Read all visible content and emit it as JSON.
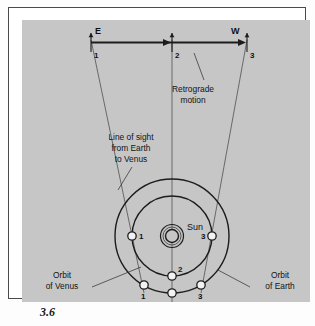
{
  "figure": {
    "caption_number": "3.6",
    "panel_bg_color": "#c6c6c6",
    "ink_color": "#1c1c1c"
  },
  "sky_scale": {
    "description": "Apparent path of Venus against the background sky",
    "direction_left_label": "E",
    "direction_right_label": "W",
    "tick_labels": [
      "1",
      "2",
      "3"
    ],
    "arrow_segments": [
      {
        "from": "1",
        "to": "2"
      },
      {
        "from": "2",
        "to": "3"
      }
    ]
  },
  "annotations": {
    "retrograde": {
      "line1": "Retrograde",
      "line2": "motion"
    },
    "line_of_sight": {
      "line1": "Line of sight",
      "line2": "from Earth",
      "line3": "to Venus"
    },
    "orbit_venus": {
      "line1": "Orbit",
      "line2": "of Venus"
    },
    "orbit_earth": {
      "line1": "Orbit",
      "line2": "of Earth"
    },
    "sun_label": "Sun"
  },
  "orbits": {
    "venus": {
      "name": "Orbit of Venus",
      "position_labels": [
        "1",
        "2",
        "3"
      ]
    },
    "earth": {
      "name": "Orbit of Earth",
      "position_labels": [
        "1",
        "2",
        "3"
      ]
    }
  },
  "bodies": {
    "sun": "Sun",
    "venus_markers": [
      "1",
      "2",
      "3"
    ],
    "earth_markers": [
      "1",
      "2",
      "3"
    ]
  }
}
